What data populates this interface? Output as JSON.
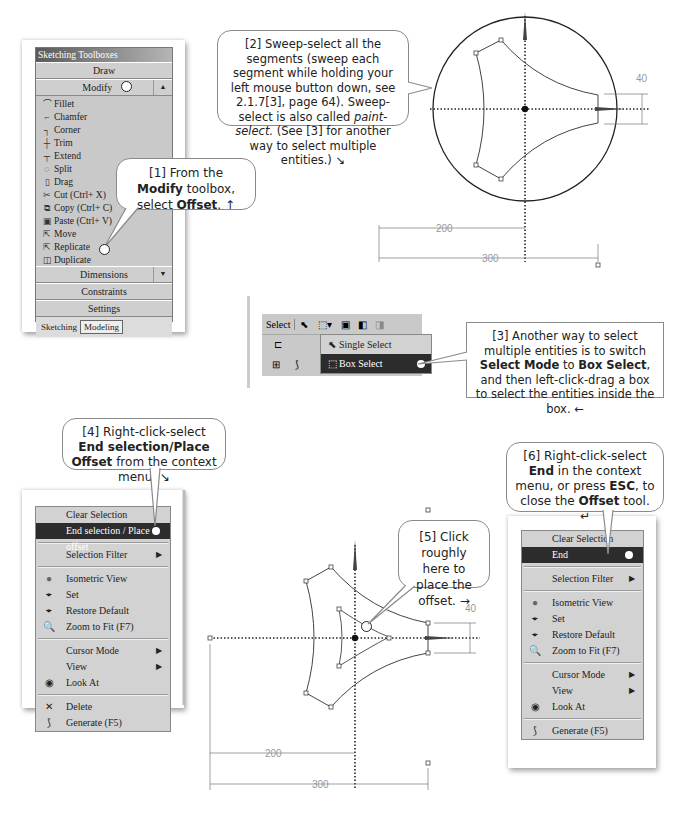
{
  "toolbox": {
    "title": "Sketching Toolboxes",
    "sections": {
      "draw": "Draw",
      "modify": "Modify",
      "dimensions": "Dimensions",
      "constraints": "Constraints",
      "settings": "Settings"
    },
    "items": [
      {
        "icon": "fillet-icon",
        "glyph": "⌒",
        "label": "Fillet"
      },
      {
        "icon": "chamfer-icon",
        "glyph": "⌐",
        "label": "Chamfer"
      },
      {
        "icon": "corner-icon",
        "glyph": "┐",
        "label": "Corner"
      },
      {
        "icon": "trim-icon",
        "glyph": "┼",
        "label": "Trim"
      },
      {
        "icon": "extend-icon",
        "glyph": "┬",
        "label": "Extend"
      },
      {
        "icon": "split-icon",
        "glyph": "◌",
        "label": "Split"
      },
      {
        "icon": "drag-icon",
        "glyph": "▯",
        "label": "Drag"
      },
      {
        "icon": "cut-icon",
        "glyph": "✂",
        "label": "Cut (Ctrl+ X)"
      },
      {
        "icon": "copy-icon",
        "glyph": "⧉",
        "label": "Copy (Ctrl+ C)"
      },
      {
        "icon": "paste-icon",
        "glyph": "▣",
        "label": "Paste (Ctrl+ V)"
      },
      {
        "icon": "move-icon",
        "glyph": "⇱",
        "label": "Move"
      },
      {
        "icon": "replicate-icon",
        "glyph": "⇱",
        "label": "Replicate"
      },
      {
        "icon": "duplicate-icon",
        "glyph": "◫",
        "label": "Duplicate"
      },
      {
        "icon": "offset-icon",
        "glyph": "≃",
        "label": "Offset"
      },
      {
        "icon": "spline-edit-icon",
        "glyph": "≫",
        "label": "Spline Edit"
      }
    ],
    "tabs": [
      "Sketching",
      "Modeling"
    ]
  },
  "callouts": {
    "c1": {
      "pre": "[1] From the ",
      "b1": "Modify",
      "mid": " toolbox, select ",
      "b2": "Offset",
      "post": ". ↑"
    },
    "c2": {
      "line1": "[2] Sweep-select all the segments (sweep each segment while holding your left mouse button down, see 2.1.7[3], page 64). Sweep-select is also called ",
      "italic": "paint-select.",
      "line2": " (See [3] for another way to select multiple entities.) ↘"
    },
    "c3": {
      "pre": "[3] Another way to select multiple entities is to switch ",
      "b1": "Select Mode",
      "mid": " to ",
      "b2": "Box Select",
      "post": ", and then left-click-drag a box to select the entities inside the box. ←"
    },
    "c4": {
      "pre": "[4] Right-click-select ",
      "b1": "End selection/Place Offset",
      "post": " from the context menu. ↘"
    },
    "c5": {
      "text": "[5] Click roughly here to place the offset. →"
    },
    "c6": {
      "pre": "[6] Right-click-select ",
      "b1": "End",
      "mid": " in the context menu, or press ",
      "b2": "ESC",
      "mid2": ", to close the ",
      "b3": "Offset",
      "post": " tool. ↵"
    }
  },
  "select_toolbar": {
    "label": "Select",
    "dropdown_items": [
      "Single Select",
      "Box Select"
    ],
    "selected": "Box Select"
  },
  "context_menu_1": {
    "items": [
      {
        "label": "Clear Selection",
        "icon": ""
      },
      {
        "label": "End selection / Place offset",
        "icon": "",
        "highlighted": true
      },
      {
        "sep": true
      },
      {
        "label": "Selection Filter",
        "icon": "",
        "submenu": true
      },
      {
        "sep": true
      },
      {
        "label": "Isometric View",
        "icon": "sphere-icon"
      },
      {
        "label": "Set",
        "icon": "iso-set-icon"
      },
      {
        "label": "Restore Default",
        "icon": "iso-restore-icon"
      },
      {
        "label": "Zoom to Fit (F7)",
        "icon": "zoom-icon"
      },
      {
        "sep": true
      },
      {
        "label": "Cursor Mode",
        "icon": "",
        "submenu": true
      },
      {
        "label": "View",
        "icon": "",
        "submenu": true
      },
      {
        "label": "Look At",
        "icon": "look-at-icon"
      },
      {
        "sep": true
      },
      {
        "label": "Delete",
        "icon": "delete-icon"
      },
      {
        "label": "Generate (F5)",
        "icon": "generate-icon"
      }
    ]
  },
  "context_menu_2": {
    "items": [
      {
        "label": "Clear Selection",
        "icon": ""
      },
      {
        "label": "End",
        "icon": "",
        "highlighted": true
      },
      {
        "sep": true
      },
      {
        "label": "Selection Filter",
        "icon": "",
        "submenu": true
      },
      {
        "sep": true
      },
      {
        "label": "Isometric View",
        "icon": "sphere-icon"
      },
      {
        "label": "Set",
        "icon": "iso-set-icon"
      },
      {
        "label": "Restore Default",
        "icon": "iso-restore-icon"
      },
      {
        "label": "Zoom to Fit (F7)",
        "icon": "zoom-icon"
      },
      {
        "sep": true
      },
      {
        "label": "Cursor Mode",
        "icon": "",
        "submenu": true
      },
      {
        "label": "View",
        "icon": "",
        "submenu": true
      },
      {
        "label": "Look At",
        "icon": "look-at-icon"
      },
      {
        "sep": true
      },
      {
        "label": "Generate (F5)",
        "icon": "generate-icon"
      }
    ]
  },
  "sketch_1": {
    "dim_vertical": "40",
    "dim_h1": "200",
    "dim_h2": "300"
  },
  "sketch_2": {
    "dim_vertical": "40",
    "dim_h1": "200",
    "dim_h2": "300"
  }
}
